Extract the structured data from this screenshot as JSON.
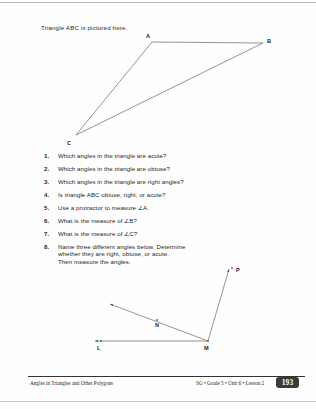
{
  "intro": {
    "text": "Triangle ABC is pictured here."
  },
  "triangle": {
    "vertices": [
      {
        "label": "A",
        "x": 152,
        "y": 42
      },
      {
        "label": "B",
        "x": 263,
        "y": 43
      },
      {
        "label": "C",
        "x": 76,
        "y": 135
      }
    ]
  },
  "angle_figure": {
    "vertex": {
      "label": "M",
      "x": 208,
      "y": 341
    },
    "rays": [
      {
        "label": "L",
        "x": 93,
        "y": 341
      },
      {
        "label": "N",
        "x": 108,
        "y": 303
      },
      {
        "label": "P",
        "x": 230,
        "y": 268
      }
    ],
    "ray_labels": [
      {
        "label": "L",
        "x": 98,
        "y": 346
      },
      {
        "label": "N",
        "x": 156,
        "y": 324
      },
      {
        "label": "P",
        "x": 236,
        "y": 270
      },
      {
        "label": "M",
        "x": 205,
        "y": 346
      }
    ]
  },
  "questions": [
    {
      "num": "1.",
      "lines": [
        "Which angles in the triangle are acute?"
      ]
    },
    {
      "num": "2.",
      "lines": [
        "Which angles in the triangle are obtuse?"
      ]
    },
    {
      "num": "3.",
      "lines": [
        "Which angles in the triangle are right angles?"
      ]
    },
    {
      "num": "4.",
      "lines": [
        "Is triangle ABC obtuse, right, or acute?"
      ]
    },
    {
      "num": "5.",
      "lines": [
        "Use a protractor to measure ∠A."
      ]
    },
    {
      "num": "6.",
      "lines": [
        "What is the measure of ∠B?"
      ]
    },
    {
      "num": "7.",
      "lines": [
        "What is the measure of ∠C?"
      ]
    },
    {
      "num": "8.",
      "lines": [
        "Name three different angles below. Determine",
        "whether they are right, obtuse, or acute.",
        "Then measure the angles."
      ]
    }
  ],
  "footer": {
    "left": "Angles in Triangles and Other Polygons",
    "right": "SG • Grade 5 • Unit 6 • Lesson 2",
    "page": "193"
  },
  "colors": {
    "ink": "#1c1c1c",
    "line": "#7a7a7a",
    "badge": "#3a3a3a"
  }
}
